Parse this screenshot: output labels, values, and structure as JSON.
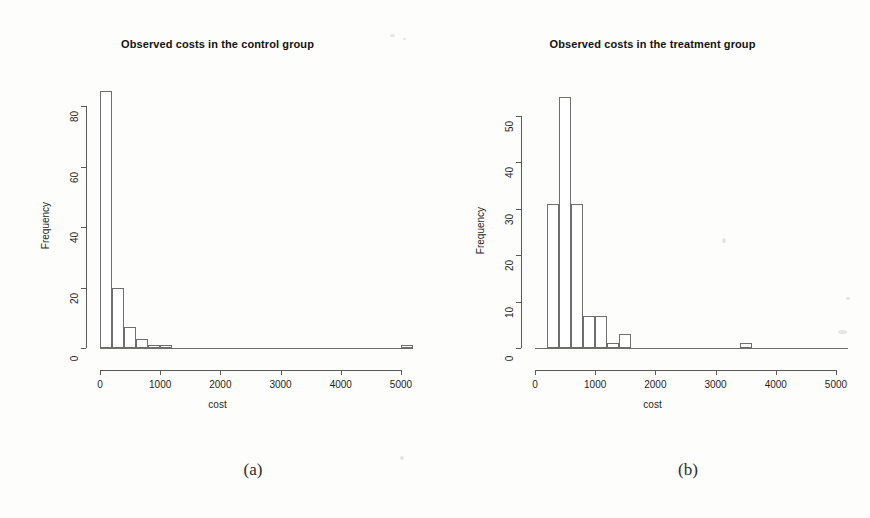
{
  "figure": {
    "background_color": "#fdfdfc",
    "axis_color": "#5a5a5a",
    "bar_outline_color": "#6e6e6e",
    "bar_fill_color": "#ffffff"
  },
  "panels": [
    {
      "id": "a",
      "caption": "(a)",
      "chart": {
        "type": "bar",
        "title": "Observed costs in the control group",
        "xlabel": "cost",
        "ylabel": "Frequency",
        "xlim": [
          0,
          5200
        ],
        "ylim": [
          0,
          86
        ],
        "xticks": [
          0,
          1000,
          2000,
          3000,
          4000,
          5000
        ],
        "xtick_labels": [
          "0",
          "1000",
          "2000",
          "3000",
          "4000",
          "5000"
        ],
        "yticks": [
          0,
          20,
          40,
          60,
          80
        ],
        "ytick_labels": [
          "0",
          "20",
          "40",
          "60",
          "80"
        ],
        "grid": false,
        "legend": null,
        "bin_width": 200,
        "bins": [
          {
            "x0": 0,
            "x1": 200,
            "value": 85
          },
          {
            "x0": 200,
            "x1": 400,
            "value": 20
          },
          {
            "x0": 400,
            "x1": 600,
            "value": 7
          },
          {
            "x0": 600,
            "x1": 800,
            "value": 3
          },
          {
            "x0": 800,
            "x1": 1000,
            "value": 1
          },
          {
            "x0": 1000,
            "x1": 1200,
            "value": 1
          },
          {
            "x0": 5000,
            "x1": 5200,
            "value": 1
          }
        ]
      }
    },
    {
      "id": "b",
      "caption": "(b)",
      "chart": {
        "type": "bar",
        "title": "Observed costs in the treatment group",
        "xlabel": "cost",
        "ylabel": "Frequency",
        "xlim": [
          0,
          5200
        ],
        "ylim": [
          0,
          56
        ],
        "xticks": [
          0,
          1000,
          2000,
          3000,
          4000,
          5000
        ],
        "xtick_labels": [
          "0",
          "1000",
          "2000",
          "3000",
          "4000",
          "5000"
        ],
        "yticks": [
          0,
          10,
          20,
          30,
          40,
          50
        ],
        "ytick_labels": [
          "0",
          "10",
          "20",
          "30",
          "40",
          "50"
        ],
        "grid": false,
        "legend": null,
        "bin_width": 200,
        "bins": [
          {
            "x0": 200,
            "x1": 400,
            "value": 31
          },
          {
            "x0": 400,
            "x1": 600,
            "value": 54
          },
          {
            "x0": 600,
            "x1": 800,
            "value": 31
          },
          {
            "x0": 800,
            "x1": 1000,
            "value": 7
          },
          {
            "x0": 1000,
            "x1": 1200,
            "value": 7
          },
          {
            "x0": 1200,
            "x1": 1400,
            "value": 1
          },
          {
            "x0": 1400,
            "x1": 1600,
            "value": 3
          },
          {
            "x0": 3400,
            "x1": 3600,
            "value": 1
          }
        ]
      }
    }
  ]
}
